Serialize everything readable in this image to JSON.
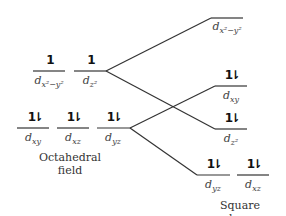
{
  "diagram": {
    "octahedral": {
      "caption_line1": "Octahedral",
      "caption_line2": "field",
      "upper_levels": [
        {
          "orbital": "x²−y²",
          "electrons": "1"
        },
        {
          "orbital": "z²",
          "electrons": "1"
        }
      ],
      "lower_levels": [
        {
          "orbital": "xy",
          "electrons": "1⇂"
        },
        {
          "orbital": "xz",
          "electrons": "1⇂"
        },
        {
          "orbital": "yz",
          "electrons": "1⇂"
        }
      ]
    },
    "square_planar": {
      "caption": "Square planar field",
      "levels": [
        {
          "orbital": "x²−y²",
          "electrons": ""
        },
        {
          "orbital": "xy",
          "electrons": "1⇂"
        },
        {
          "orbital": "z²",
          "electrons": "1⇂"
        },
        {
          "orbital": "yz",
          "electrons": "1⇂"
        },
        {
          "orbital": "xz",
          "electrons": "1⇂"
        }
      ]
    },
    "colors": {
      "line": "#333333",
      "text": "#444444"
    }
  }
}
